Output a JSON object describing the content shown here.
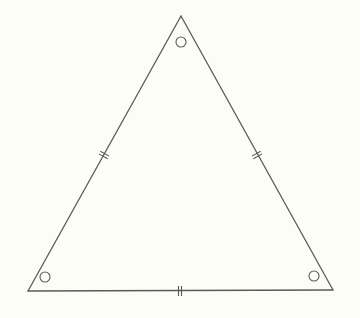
{
  "diagram": {
    "title": "",
    "type": "equilateral-triangle",
    "background": "#fdfdf8",
    "stroke_color": "#5a5a5a",
    "vertices": {
      "top": [
        181,
        16
      ],
      "bottom_left": [
        28,
        291
      ],
      "bottom_right": [
        333,
        290
      ]
    },
    "angle_markers": [
      {
        "vertex": "top",
        "cx": 181,
        "cy": 42,
        "r": 5,
        "symbol": "circle"
      },
      {
        "vertex": "bottom_left",
        "cx": 45,
        "cy": 277,
        "r": 5,
        "symbol": "circle"
      },
      {
        "vertex": "bottom_right",
        "cx": 314,
        "cy": 276,
        "r": 5,
        "symbol": "circle"
      }
    ],
    "side_markers": [
      {
        "side": "left",
        "cx": 104,
        "cy": 155,
        "ticks": 2
      },
      {
        "side": "right",
        "cx": 257,
        "cy": 155,
        "ticks": 2
      },
      {
        "side": "bottom",
        "cx": 180,
        "cy": 291,
        "ticks": 2
      }
    ]
  }
}
